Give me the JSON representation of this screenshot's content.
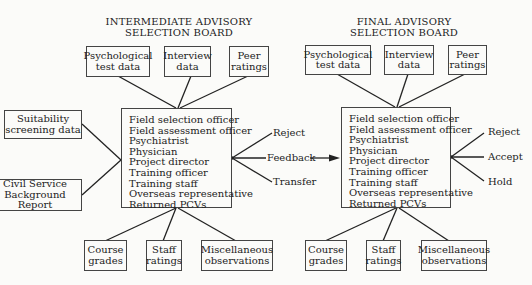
{
  "intermediate": {
    "title_line1": "INTERMEDIATE ADVISORY",
    "title_line2": "SELECTION BOARD",
    "inputs_top": [
      "Psychological\ntest data",
      "Interview\ndata",
      "Peer\nratings"
    ],
    "inputs_left": [
      "Suitability\nscreening data",
      "Civil Service\nBackground Report"
    ],
    "members": [
      "Field selection officer",
      "Field assessment officer",
      "Psychiatrist",
      "Physician",
      "Project director",
      "Training officer",
      "Training staff",
      "Overseas representative",
      "Returned PCVs"
    ],
    "inputs_bottom": [
      "Course\ngrades",
      "Staff\nratings",
      "Miscellaneous\nobservations"
    ],
    "outcomes": [
      "Reject",
      "Feedback",
      "Transfer"
    ]
  },
  "final": {
    "title_line1": "FINAL ADVISORY",
    "title_line2": "SELECTION BOARD",
    "inputs_top": [
      "Psychological\ntest data",
      "Interview\ndata",
      "Peer\nratings"
    ],
    "members": [
      "Field selection officer",
      "Field assessment officer",
      "Psychiatrist",
      "Physician",
      "Project director",
      "Training officer",
      "Training staff",
      "Overseas representative",
      "Returned PCVs"
    ],
    "inputs_bottom": [
      "Course\ngrades",
      "Staff\nratings",
      "Miscellaneous\nobservations"
    ],
    "outcomes": [
      "Reject",
      "Accept",
      "Hold"
    ]
  }
}
